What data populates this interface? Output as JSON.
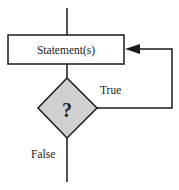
{
  "diagram": {
    "type": "flowchart",
    "nodes": [
      {
        "id": "statement",
        "shape": "rectangle",
        "label": "Statement(s)"
      },
      {
        "id": "condition",
        "shape": "diamond",
        "label": "?"
      }
    ],
    "edges": [
      {
        "from": "entry",
        "to": "statement",
        "label": ""
      },
      {
        "from": "statement",
        "to": "condition",
        "label": ""
      },
      {
        "from": "condition",
        "to": "statement",
        "label": "True"
      },
      {
        "from": "condition",
        "to": "exit",
        "label": "False"
      }
    ],
    "labels": {
      "statement": "Statement(s)",
      "condition": "?",
      "true_branch": "True",
      "false_branch": "False"
    },
    "colors": {
      "stroke": "#1a1a1a",
      "diamond_fill": "#d0d0d0",
      "box_fill": "#ffffff"
    }
  }
}
